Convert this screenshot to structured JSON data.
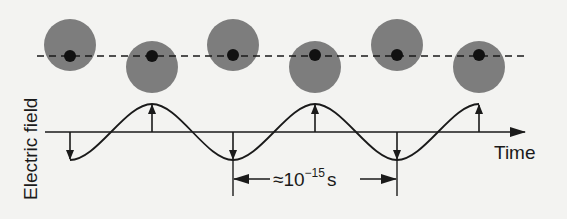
{
  "diagram": {
    "labels": {
      "y_axis": "Electric field",
      "x_axis": "Time",
      "period_prefix": "≈10",
      "period_exponent": "−15",
      "period_unit": "s"
    },
    "atoms": [
      {
        "x": 70,
        "y": 45,
        "position": "up"
      },
      {
        "x": 152,
        "y": 67,
        "position": "down"
      },
      {
        "x": 233,
        "y": 45,
        "position": "up"
      },
      {
        "x": 315,
        "y": 67,
        "position": "down"
      },
      {
        "x": 397,
        "y": 45,
        "position": "up"
      },
      {
        "x": 479,
        "y": 67,
        "position": "down"
      }
    ],
    "field_arrows": [
      {
        "x": 70,
        "direction": "down"
      },
      {
        "x": 152,
        "direction": "up"
      },
      {
        "x": 233,
        "direction": "down"
      },
      {
        "x": 315,
        "direction": "up"
      },
      {
        "x": 397,
        "direction": "down"
      },
      {
        "x": 479,
        "direction": "up"
      }
    ],
    "colors": {
      "atom_cloud": "#7d7d7d",
      "nucleus": "#111111",
      "line": "#1a1a1a",
      "background": "#f3f3f1"
    }
  }
}
